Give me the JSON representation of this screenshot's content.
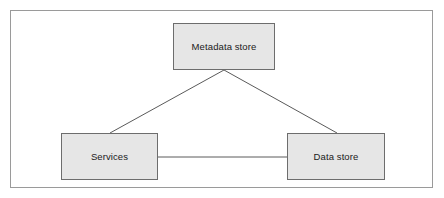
{
  "diagram": {
    "canvas": {
      "width": 444,
      "height": 198,
      "background": "#ffffff"
    },
    "frame": {
      "border_color": "#9a9a9a",
      "x": 10,
      "y": 10,
      "width": 423,
      "height": 178
    },
    "style": {
      "node_fill": "#e6e6e6",
      "node_border": "#6d6d6d",
      "edge_color": "#5a5a5a",
      "text_color": "#1a1a1a"
    },
    "nodes": [
      {
        "id": "metadata-store",
        "label": "Metadata store",
        "x": 173,
        "y": 23,
        "width": 102,
        "height": 47
      },
      {
        "id": "services",
        "label": "Services",
        "x": 61,
        "y": 133,
        "width": 97,
        "height": 47
      },
      {
        "id": "data-store",
        "label": "Data store",
        "x": 287,
        "y": 133,
        "width": 98,
        "height": 47
      }
    ],
    "edges": [
      {
        "id": "metadata-to-services",
        "from": "metadata-store",
        "to": "services",
        "kind": "diagonal",
        "x1": 224,
        "y1": 70,
        "x2": 110,
        "y2": 133
      },
      {
        "id": "metadata-to-data-store",
        "from": "metadata-store",
        "to": "data-store",
        "kind": "diagonal",
        "x1": 224,
        "y1": 70,
        "x2": 337,
        "y2": 133
      },
      {
        "id": "services-to-data-store",
        "from": "services",
        "to": "data-store",
        "kind": "horizontal",
        "x1": 158,
        "y1": 157,
        "x2": 287,
        "y2": 157
      }
    ]
  }
}
